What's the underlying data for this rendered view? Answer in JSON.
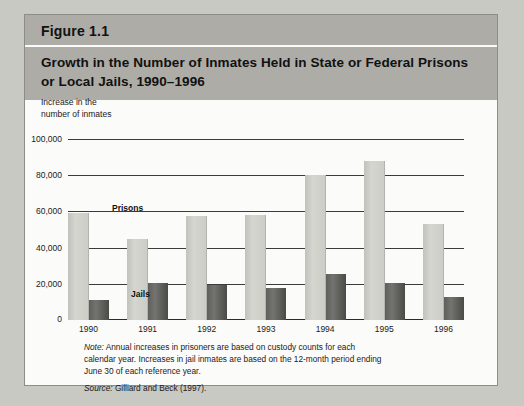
{
  "figure": {
    "number_label": "Figure 1.1",
    "title": "Growth in the Number of Inmates Held in State or Federal Prisons or Local Jails, 1990–1996"
  },
  "axis_caption": "Increase in the\nnumber of inmates",
  "series_labels": {
    "prisons": "Prisons",
    "jails": "Jails"
  },
  "footnotes": {
    "note_prefix": "Note:",
    "note_text": " Annual increases in prisoners are based on custody counts for each calendar year. Increases in jail inmates are based on the 12-month period ending June 30 of each reference year.",
    "source_prefix": "Source:",
    "source_text": " Gilliard and Beck (1997)."
  },
  "colors": {
    "header_band": "#adaca7",
    "page_background": "#c9c9c4",
    "card_background": "#fbfbf9",
    "prisons_bar": "#d0d0cb",
    "jails_bar": "#5a5a57",
    "gridline": "#3b3b3b"
  },
  "chart_data": {
    "type": "bar",
    "title": "Growth in the Number of Inmates Held in State or Federal Prisons or Local Jails, 1990–1996",
    "xlabel": "",
    "ylabel": "Increase in the number of inmates",
    "categories": [
      "1990",
      "1991",
      "1992",
      "1993",
      "1994",
      "1995",
      "1996"
    ],
    "series": [
      {
        "name": "Prisons",
        "values": [
          59000,
          44500,
          57500,
          58000,
          80000,
          88000,
          53000
        ]
      },
      {
        "name": "Jails",
        "values": [
          11000,
          20500,
          19500,
          17500,
          25500,
          20500,
          12500
        ]
      }
    ],
    "ylim": [
      0,
      100000
    ],
    "yticks": [
      0,
      20000,
      40000,
      60000,
      80000,
      100000
    ],
    "ytick_labels": [
      "0",
      "20,000",
      "40,000",
      "60,000",
      "80,000",
      "100,000"
    ],
    "grid": true,
    "legend": "inline-annotations"
  }
}
